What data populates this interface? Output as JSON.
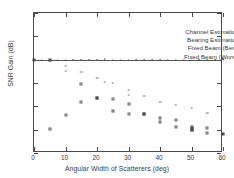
{
  "chart_data": {
    "type": "scatter",
    "title": "",
    "xlabel": "Angular Width of Scatterers (deg)",
    "ylabel": "SNR Gain (dB)",
    "xlim": [
      0,
      60
    ],
    "ylim": [
      5,
      11
    ],
    "xticks": [
      0,
      10,
      20,
      30,
      40,
      50,
      60
    ],
    "yticks": [
      5,
      6,
      7,
      8,
      9,
      10,
      11
    ],
    "grid": false,
    "legend_position": "top-right-inside",
    "series": [
      {
        "name": "Channel Estimation",
        "marker": "dot",
        "points": [
          [
            0,
            9.0
          ],
          [
            2.5,
            9.0
          ],
          [
            5,
            8.97
          ],
          [
            7.5,
            9.0
          ],
          [
            10,
            9.0
          ],
          [
            12.5,
            9.0
          ],
          [
            15,
            9.0
          ],
          [
            17.5,
            9.0
          ],
          [
            20,
            9.0
          ],
          [
            22.5,
            9.02
          ],
          [
            25,
            9.0
          ],
          [
            27.5,
            9.0
          ],
          [
            30,
            9.0
          ],
          [
            32.5,
            9.0
          ],
          [
            35,
            9.0
          ],
          [
            37.5,
            9.0
          ],
          [
            40,
            9.0
          ],
          [
            42.5,
            9.0
          ],
          [
            45,
            9.0
          ],
          [
            47.5,
            9.0
          ],
          [
            50,
            9.04
          ],
          [
            52.5,
            9.0
          ],
          [
            55,
            9.0
          ],
          [
            57.5,
            9.0
          ],
          [
            60,
            9.03
          ]
        ]
      },
      {
        "name": "Bearing Estimation",
        "marker": "tick",
        "points": [
          [
            0,
            9.0
          ],
          [
            5,
            8.96
          ],
          [
            10,
            8.72
          ],
          [
            10,
            8.5
          ],
          [
            15,
            8.48
          ],
          [
            20,
            8.22
          ],
          [
            22.5,
            8.05
          ],
          [
            25,
            7.98
          ],
          [
            30,
            7.72
          ],
          [
            30,
            7.48
          ],
          [
            35,
            7.45
          ],
          [
            40,
            7.18
          ],
          [
            45,
            7.05
          ],
          [
            50,
            6.92
          ],
          [
            55,
            6.72
          ],
          [
            60,
            5.82
          ],
          [
            0,
            5.22
          ]
        ]
      },
      {
        "name": "Fixed Beam (Best)",
        "marker": "square",
        "points": [
          [
            10,
            6.65
          ],
          [
            15,
            7.95
          ],
          [
            15,
            7.18
          ],
          [
            20,
            7.35
          ],
          [
            25,
            7.3
          ],
          [
            25,
            6.82
          ],
          [
            30,
            7.08
          ],
          [
            30,
            6.68
          ],
          [
            35,
            6.68
          ],
          [
            40,
            6.5
          ],
          [
            40,
            6.32
          ],
          [
            45,
            6.42
          ],
          [
            45,
            6.1
          ],
          [
            50,
            6.12
          ],
          [
            50,
            6.0
          ],
          [
            55,
            6.08
          ],
          [
            55,
            5.86
          ],
          [
            5,
            6.02
          ]
        ]
      },
      {
        "name": "Fixed Beam (Worst)",
        "marker": "filled-square",
        "points": [
          [
            0,
            9.0
          ],
          [
            5,
            8.97
          ],
          [
            20,
            7.35
          ],
          [
            35,
            6.68
          ],
          [
            50,
            6.06
          ],
          [
            50,
            5.98
          ],
          [
            60,
            5.82
          ]
        ]
      }
    ],
    "reference_line": {
      "y": 9.0,
      "description": "horizontal line at 9 dB"
    }
  },
  "legend": {
    "entries": [
      {
        "label": "Channel Estimation",
        "marker": "dot"
      },
      {
        "label": "Bearing Estimation",
        "marker": "tick"
      },
      {
        "label": "Fixed Beam (Best)",
        "marker": "square"
      },
      {
        "label": "Fixed Beam (Worst)",
        "marker": "filled-square"
      }
    ]
  }
}
